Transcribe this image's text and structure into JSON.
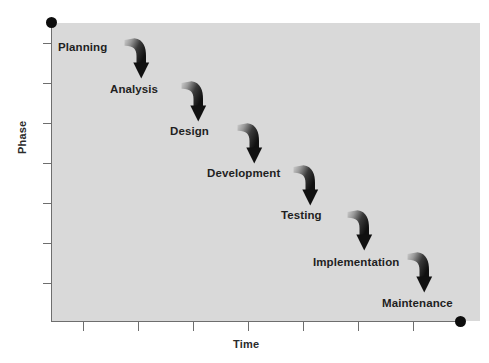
{
  "figure": {
    "title": "",
    "background_color": "#ffffff",
    "plot_background_color": "#d9d9d9",
    "axis_color": "#6e6e6e",
    "marker_color": "#0d0d0d",
    "label_color": "#1f1f1f"
  },
  "axes": {
    "y_title": "Phase",
    "x_title": "Time",
    "y_ticks": 7,
    "x_ticks": 7,
    "y_endpoint_marker": "axis-end-dot",
    "x_endpoint_marker": "axis-end-dot"
  },
  "chart_data": {
    "type": "scatter",
    "title": "",
    "xlabel": "Time",
    "ylabel": "Phase",
    "grid": false,
    "legend": null,
    "categories": [
      "Planning",
      "Analysis",
      "Design",
      "Development",
      "Testing",
      "Implementation",
      "Maintenance"
    ],
    "x": [
      1,
      2,
      3,
      4,
      5,
      6,
      7
    ],
    "values": [
      7,
      6,
      5,
      4,
      3,
      2,
      1
    ],
    "xlim": [
      0,
      8
    ],
    "ylim": [
      0,
      8
    ],
    "annotations": [
      "Planning",
      "Analysis",
      "Design",
      "Development",
      "Testing",
      "Implementation",
      "Maintenance"
    ],
    "connector_count": 6,
    "connector_type": "curved-down-arrow"
  },
  "phases": [
    {
      "label": "Planning",
      "left": 58,
      "top": 41
    },
    {
      "label": "Analysis",
      "left": 110,
      "top": 83
    },
    {
      "label": "Design",
      "left": 170,
      "top": 125
    },
    {
      "label": "Development",
      "left": 207,
      "top": 167
    },
    {
      "label": "Testing",
      "left": 281,
      "top": 209
    },
    {
      "label": "Implementation",
      "left": 313,
      "top": 256
    },
    {
      "label": "Maintenance",
      "left": 382,
      "top": 297
    }
  ],
  "arrows": [
    {
      "name": "arrow-planning-to-analysis",
      "left": 121,
      "top": 36
    },
    {
      "name": "arrow-analysis-to-design",
      "left": 178,
      "top": 79
    },
    {
      "name": "arrow-design-to-development",
      "left": 234,
      "top": 121
    },
    {
      "name": "arrow-development-to-testing",
      "left": 290,
      "top": 163
    },
    {
      "name": "arrow-testing-to-implementation",
      "left": 344,
      "top": 208
    },
    {
      "name": "arrow-implementation-to-maintenance",
      "left": 404,
      "top": 250
    }
  ],
  "y_tick_positions": [
    43,
    83,
    123,
    163,
    203,
    243,
    283
  ],
  "x_tick_positions": [
    83,
    138,
    193,
    248,
    303,
    358,
    413
  ]
}
